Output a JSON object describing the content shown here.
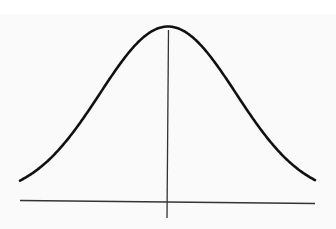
{
  "figure": {
    "title": "",
    "colors": {
      "background": "#fafafa",
      "curve": "#111111",
      "axis": "#333333",
      "mean_line": "#333333"
    },
    "curve": {
      "type": "gaussian",
      "center_x_px": 168,
      "sigma_px": 68,
      "peak_y_px": 30,
      "baseline_y_px": 200,
      "x_start_px": 20,
      "x_end_px": 315,
      "stroke_width": 2.6
    },
    "x_axis": {
      "x1": 20,
      "y1": 200.5,
      "x2": 315,
      "y2": 203.5,
      "stroke_width": 1.4
    },
    "mean_line": {
      "x1": 168.5,
      "y1": 30,
      "x2": 167,
      "y2": 218,
      "stroke_width": 1.3
    },
    "labels": []
  }
}
